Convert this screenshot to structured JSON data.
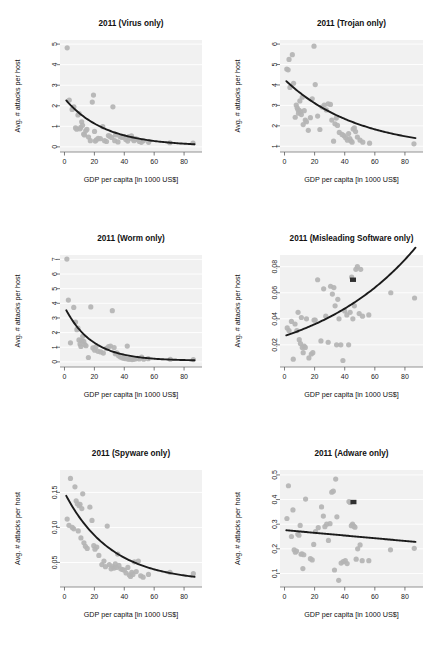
{
  "figure": {
    "title": "",
    "panel_count": 6,
    "colors": {
      "panel_background": "#f1f1f1",
      "gridline": "#ffffff",
      "point": "#b4b4b4",
      "highlight_point": "#303030",
      "fit_line": "#1b1b1b",
      "text": "#111111"
    },
    "shared_xlabel": "GDP per capita [in 1000 US$]",
    "shared_ylabel": "Avg. # attacks per host"
  },
  "chart_data": [
    {
      "type": "scatter",
      "panel_id": "virus",
      "title": "2011 (Virus only)",
      "xlabel": "GDP per capita [in 1000 US$]",
      "ylabel": "Avg. # attacks per host",
      "xlim": [
        -3,
        92
      ],
      "ylim": [
        -0.25,
        5.2
      ],
      "xticks": [
        0,
        20,
        40,
        60,
        80
      ],
      "yticks": [
        0,
        1,
        2,
        3,
        4,
        5
      ],
      "ytick_labels": [
        "0",
        "1",
        "2",
        "3",
        "4",
        "5"
      ],
      "grid": true,
      "legend": "none",
      "x": [
        1.8,
        3.2,
        5.1,
        6.3,
        7.4,
        8.2,
        9.0,
        9.8,
        10.4,
        10.9,
        11.5,
        12.1,
        12.8,
        13.4,
        14.2,
        15.0,
        16.1,
        17.3,
        18.6,
        19.4,
        20.1,
        20.6,
        21.3,
        22.5,
        24.0,
        25.6,
        26.8,
        28.1,
        29.4,
        30.2,
        31.5,
        32.4,
        33.6,
        34.2,
        35.8,
        37.1,
        38.5,
        39.8,
        41.0,
        42.3,
        43.1,
        44.0,
        44.8,
        45.6,
        46.5,
        47.4,
        48.6,
        50.1,
        51.4,
        52.8,
        56.3,
        70.5,
        86.0
      ],
      "y": [
        4.82,
        2.28,
        1.82,
        1.95,
        0.92,
        0.86,
        1.55,
        1.62,
        0.88,
        0.95,
        1.22,
        1.05,
        0.62,
        0.58,
        0.78,
        0.85,
        0.48,
        0.3,
        2.18,
        2.52,
        0.75,
        0.28,
        0.34,
        0.42,
        0.4,
        0.98,
        0.3,
        0.26,
        0.55,
        0.52,
        0.46,
        1.95,
        0.3,
        0.58,
        0.24,
        0.5,
        0.46,
        0.5,
        0.36,
        0.28,
        0.5,
        0.42,
        0.54,
        0.38,
        0.3,
        0.4,
        0.36,
        0.26,
        0.22,
        0.3,
        0.22,
        0.2,
        0.18
      ],
      "highlight_points": [],
      "fit": {
        "kind": "exponential-decay",
        "a": 2.32,
        "b": 0.0375,
        "c": 0.04,
        "x_start": 1.2,
        "x_end": 87.0,
        "description": "Avg attacks per host decrease sharply with GDP per capita"
      }
    },
    {
      "type": "scatter",
      "panel_id": "trojan",
      "title": "2011 (Trojan only)",
      "xlabel": "GDP per capita [in 1000 US$]",
      "ylabel": "Avg. # attacks per host",
      "xlim": [
        -3,
        92
      ],
      "ylim": [
        0.72,
        6.2
      ],
      "xticks": [
        0,
        20,
        40,
        60,
        80
      ],
      "yticks": [
        1,
        2,
        3,
        4,
        5,
        6
      ],
      "ytick_labels": [
        "1",
        "2",
        "3",
        "4",
        "5",
        "6"
      ],
      "grid": true,
      "legend": "none",
      "x": [
        1.5,
        2.4,
        3.0,
        3.6,
        5.2,
        6.0,
        7.1,
        7.8,
        8.4,
        8.9,
        9.3,
        9.8,
        10.2,
        10.6,
        11.2,
        11.8,
        12.4,
        13.1,
        13.8,
        14.6,
        15.8,
        17.2,
        18.4,
        19.6,
        20.4,
        22.0,
        23.5,
        25.0,
        26.4,
        27.8,
        29.0,
        30.5,
        31.4,
        32.6,
        33.5,
        34.4,
        35.2,
        36.4,
        38.2,
        39.5,
        40.6,
        41.8,
        42.6,
        43.4,
        44.2,
        44.9,
        45.6,
        46.4,
        47.2,
        48.4,
        50.2,
        52.0,
        56.5,
        86.0
      ],
      "y": [
        4.78,
        4.74,
        5.25,
        3.88,
        5.48,
        4.08,
        2.42,
        3.02,
        2.88,
        2.8,
        2.62,
        2.76,
        3.22,
        2.68,
        2.55,
        3.4,
        2.06,
        2.74,
        2.28,
        2.2,
        1.78,
        2.4,
        3.32,
        5.9,
        4.02,
        2.48,
        1.82,
        2.92,
        3.02,
        2.78,
        3.08,
        3.05,
        2.28,
        1.25,
        2.1,
        2.38,
        2.02,
        1.68,
        1.58,
        1.52,
        1.42,
        1.3,
        1.62,
        1.38,
        1.26,
        1.2,
        1.84,
        1.9,
        1.72,
        1.45,
        1.3,
        1.2,
        1.15,
        1.12
      ],
      "highlight_points": [],
      "fit": {
        "kind": "exponential-decay",
        "a": 3.45,
        "b": 0.0205,
        "c": 0.82,
        "x_start": 1.2,
        "x_end": 87.0,
        "description": "Trojan attacks per host decline with GDP per capita"
      }
    },
    {
      "type": "scatter",
      "panel_id": "worm",
      "title": "2011 (Worm only)",
      "xlabel": "GDP per capita [in 1000 US$]",
      "ylabel": "Avg. # attacks per host",
      "xlim": [
        -3,
        92
      ],
      "ylim": [
        -0.35,
        7.3
      ],
      "xticks": [
        0,
        20,
        40,
        60,
        80
      ],
      "yticks": [
        0,
        1,
        2,
        3,
        4,
        5,
        6,
        7
      ],
      "ytick_labels": [
        "0",
        "1",
        "2",
        "3",
        "4",
        "5",
        "6",
        "7"
      ],
      "grid": true,
      "legend": "none",
      "x": [
        1.6,
        2.6,
        4.0,
        6.2,
        7.4,
        8.3,
        9.0,
        9.7,
        10.4,
        11.0,
        11.6,
        12.2,
        12.9,
        13.6,
        14.4,
        16.0,
        17.6,
        19.0,
        20.2,
        21.0,
        22.4,
        24.2,
        26.0,
        28.0,
        29.5,
        30.8,
        32.0,
        33.2,
        34.0,
        35.0,
        36.2,
        37.4,
        38.6,
        39.8,
        41.0,
        42.0,
        42.8,
        43.6,
        44.4,
        45.2,
        46.2,
        47.4,
        48.6,
        50.0,
        51.6,
        53.0,
        56.0,
        70.8,
        86.2
      ],
      "y": [
        7.02,
        4.22,
        1.3,
        3.72,
        2.72,
        2.2,
        2.3,
        1.5,
        1.22,
        1.05,
        1.45,
        1.75,
        1.4,
        1.18,
        1.1,
        0.3,
        3.75,
        0.95,
        0.8,
        1.02,
        0.72,
        0.68,
        0.6,
        0.92,
        1.05,
        1.08,
        3.5,
        0.98,
        0.55,
        0.62,
        0.42,
        0.34,
        0.28,
        0.24,
        0.22,
        1.08,
        0.18,
        0.2,
        0.22,
        0.16,
        0.18,
        0.2,
        0.24,
        0.2,
        0.32,
        0.18,
        0.22,
        0.18,
        0.16
      ],
      "highlight_points": [],
      "fit": {
        "kind": "exponential-decay",
        "a": 3.68,
        "b": 0.055,
        "c": 0.08,
        "x_start": 1.2,
        "x_end": 87.0,
        "description": "Worm attacks per host drop steeply then flatten"
      }
    },
    {
      "type": "scatter",
      "panel_id": "misleading-software",
      "title": "2011 (Misleading Software only)",
      "xlabel": "GDP per capita [in 1000 US$]",
      "ylabel": "Avg. # attacks per host",
      "xlim": [
        -3,
        92
      ],
      "ylim": [
        0.003,
        0.089
      ],
      "xticks": [
        0,
        20,
        40,
        60,
        80
      ],
      "yticks": [
        0.02,
        0.04,
        0.06,
        0.08
      ],
      "ytick_labels": [
        "0.02",
        "0.04",
        "0.06",
        "0.08"
      ],
      "grid": true,
      "legend": "none",
      "x": [
        1.8,
        3.0,
        4.6,
        5.8,
        7.0,
        8.2,
        9.0,
        9.8,
        10.6,
        11.2,
        11.8,
        12.4,
        13.0,
        13.8,
        14.6,
        16.2,
        17.8,
        18.8,
        19.6,
        20.4,
        22.0,
        24.2,
        26.0,
        27.4,
        29.0,
        30.6,
        31.8,
        32.8,
        33.6,
        34.6,
        35.4,
        36.2,
        37.4,
        38.8,
        40.0,
        41.4,
        42.6,
        43.6,
        44.6,
        45.4,
        46.4,
        47.4,
        48.4,
        49.6,
        50.6,
        51.8,
        56.0,
        70.6,
        86.4
      ],
      "y": [
        0.033,
        0.031,
        0.038,
        0.009,
        0.036,
        0.031,
        0.045,
        0.024,
        0.021,
        0.041,
        0.018,
        0.014,
        0.019,
        0.018,
        0.04,
        0.01,
        0.013,
        0.014,
        0.039,
        0.039,
        0.07,
        0.023,
        0.063,
        0.042,
        0.022,
        0.065,
        0.059,
        0.064,
        0.05,
        0.02,
        0.055,
        0.04,
        0.02,
        0.008,
        0.046,
        0.043,
        0.02,
        0.045,
        0.072,
        0.04,
        0.05,
        0.078,
        0.08,
        0.044,
        0.078,
        0.042,
        0.043,
        0.06,
        0.056
      ],
      "highlight_points": [
        {
          "x": 45.5,
          "y": 0.07
        }
      ],
      "fit": {
        "kind": "exponential-growth",
        "a": 0.0268,
        "b": 0.0145,
        "x_start": 1.2,
        "x_end": 87.0,
        "description": "Misleading software attacks per host increase with GDP per capita"
      }
    },
    {
      "type": "scatter",
      "panel_id": "spyware",
      "title": "2011 (Spyware only)",
      "xlabel": "GDP per capita [in 1000 US$]",
      "ylabel": "Avg. # attacks per host",
      "xlim": [
        -3,
        92
      ],
      "ylim": [
        0.015,
        0.182
      ],
      "xticks": [
        0,
        20,
        40,
        60,
        80
      ],
      "yticks": [
        0.05,
        0.1,
        0.15
      ],
      "ytick_labels": [
        "0.05",
        "0.10",
        "0.15"
      ],
      "grid": true,
      "legend": "none",
      "x": [
        1.8,
        3.0,
        4.0,
        5.2,
        6.2,
        7.0,
        7.8,
        8.6,
        9.2,
        9.8,
        10.4,
        11.0,
        11.6,
        12.2,
        13.0,
        14.0,
        15.2,
        17.0,
        18.4,
        19.6,
        20.4,
        21.6,
        23.0,
        25.0,
        26.4,
        27.4,
        28.6,
        30.0,
        31.2,
        32.4,
        33.2,
        34.0,
        34.8,
        35.6,
        36.4,
        37.6,
        38.8,
        40.0,
        41.2,
        42.4,
        43.4,
        44.2,
        45.0,
        45.8,
        46.8,
        48.0,
        49.4,
        51.0,
        52.6,
        56.2,
        70.6,
        86.2
      ],
      "y": [
        0.112,
        0.103,
        0.17,
        0.1,
        0.098,
        0.158,
        0.138,
        0.134,
        0.095,
        0.131,
        0.133,
        0.085,
        0.127,
        0.148,
        0.078,
        0.073,
        0.07,
        0.129,
        0.11,
        0.074,
        0.069,
        0.072,
        0.06,
        0.047,
        0.052,
        0.044,
        0.102,
        0.047,
        0.041,
        0.044,
        0.042,
        0.048,
        0.043,
        0.062,
        0.046,
        0.041,
        0.04,
        0.039,
        0.035,
        0.043,
        0.032,
        0.03,
        0.036,
        0.033,
        0.051,
        0.037,
        0.052,
        0.031,
        0.029,
        0.033,
        0.036,
        0.034
      ],
      "highlight_points": [],
      "fit": {
        "kind": "exponential-decay",
        "a": 0.128,
        "b": 0.0325,
        "c": 0.022,
        "x_start": 1.2,
        "x_end": 87.0,
        "description": "Spyware attacks per host decrease with GDP per capita"
      }
    },
    {
      "type": "scatter",
      "panel_id": "adware",
      "title": "2011 (Adware only)",
      "xlabel": "GDP per capita [in 1000 US$]",
      "ylabel": "Avg. # attacks per host",
      "xlim": [
        -3,
        92
      ],
      "ylim": [
        0.045,
        0.52
      ],
      "xticks": [
        0,
        20,
        40,
        60,
        80
      ],
      "yticks": [
        0.1,
        0.2,
        0.3,
        0.4,
        0.5
      ],
      "ytick_labels": [
        "0.1",
        "0.2",
        "0.3",
        "0.4",
        "0.5"
      ],
      "grid": true,
      "legend": "none",
      "x": [
        1.6,
        2.6,
        4.6,
        5.6,
        6.4,
        7.2,
        8.0,
        8.8,
        9.6,
        10.4,
        11.0,
        11.6,
        12.2,
        12.8,
        14.0,
        17.2,
        18.4,
        19.4,
        20.6,
        22.4,
        24.6,
        25.8,
        26.8,
        28.0,
        29.2,
        30.2,
        31.4,
        32.4,
        33.2,
        34.0,
        34.8,
        36.0,
        37.6,
        39.0,
        40.4,
        41.6,
        42.8,
        43.6,
        44.4,
        45.2,
        46.0,
        46.8,
        47.6,
        48.6,
        50.2,
        51.6,
        56.0,
        70.4,
        86.2
      ],
      "y": [
        0.323,
        0.456,
        0.25,
        0.358,
        0.196,
        0.186,
        0.191,
        0.26,
        0.255,
        0.295,
        0.178,
        0.18,
        0.12,
        0.176,
        0.402,
        0.16,
        0.155,
        0.218,
        0.27,
        0.286,
        0.37,
        0.333,
        0.29,
        0.3,
        0.234,
        0.302,
        0.43,
        0.434,
        0.114,
        0.483,
        0.33,
        0.072,
        0.142,
        0.148,
        0.152,
        0.14,
        0.392,
        0.388,
        0.294,
        0.3,
        0.292,
        0.288,
        0.158,
        0.2,
        0.216,
        0.152,
        0.152,
        0.196,
        0.202
      ],
      "highlight_points": [
        {
          "x": 45.8,
          "y": 0.39
        }
      ],
      "fit": {
        "kind": "linear",
        "intercept": 0.276,
        "slope": -0.00055,
        "x_start": 1.2,
        "x_end": 87.0,
        "description": "Adware attacks per host show a slight decline with GDP per capita"
      }
    }
  ]
}
